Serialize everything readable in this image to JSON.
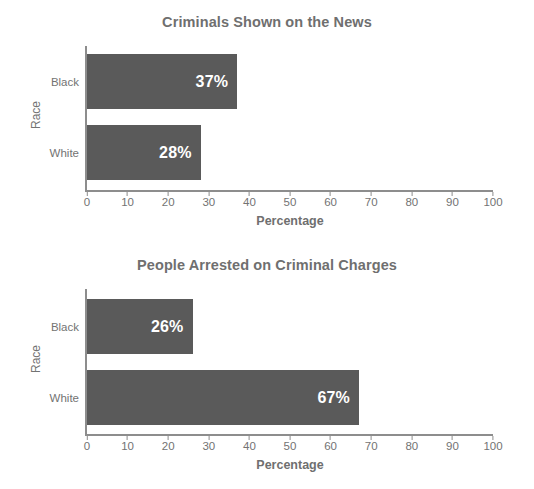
{
  "chart_data": [
    {
      "type": "bar",
      "orientation": "horizontal",
      "title": "Criminals Shown on the News",
      "categories": [
        "Black",
        "White"
      ],
      "values": [
        37,
        28
      ],
      "value_labels": [
        "37%",
        "28%"
      ],
      "xlabel": "Percentage",
      "ylabel": "Race",
      "xlim": [
        0,
        100
      ],
      "xticks": [
        0,
        10,
        20,
        30,
        40,
        50,
        60,
        70,
        80,
        90,
        100
      ],
      "xtick_labels": [
        "0",
        "10",
        "20",
        "30",
        "40",
        "50",
        "60",
        "70",
        "80",
        "90",
        "100"
      ],
      "grid": false,
      "legend": false,
      "bar_color": "#5a5a5a",
      "value_label_color": "#ffffff",
      "title_color": "#6f6f6f",
      "axis_color": "#8d8d8d"
    },
    {
      "type": "bar",
      "orientation": "horizontal",
      "title": "People Arrested on Criminal Charges",
      "categories": [
        "Black",
        "White"
      ],
      "values": [
        26,
        67
      ],
      "value_labels": [
        "26%",
        "67%"
      ],
      "xlabel": "Percentage",
      "ylabel": "Race",
      "xlim": [
        0,
        100
      ],
      "xticks": [
        0,
        10,
        20,
        30,
        40,
        50,
        60,
        70,
        80,
        90,
        100
      ],
      "xtick_labels": [
        "0",
        "10",
        "20",
        "30",
        "40",
        "50",
        "60",
        "70",
        "80",
        "90",
        "100"
      ],
      "grid": false,
      "legend": false,
      "bar_color": "#5a5a5a",
      "value_label_color": "#ffffff",
      "title_color": "#6f6f6f",
      "axis_color": "#8d8d8d"
    }
  ]
}
